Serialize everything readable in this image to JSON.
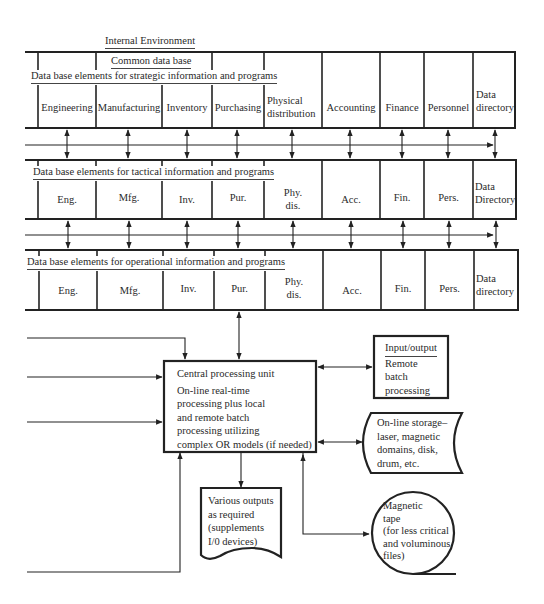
{
  "title": "Internal Environment",
  "common_db": "Common data base",
  "bands": {
    "strategic": {
      "label": "Data base elements for strategic information and programs",
      "cells": [
        "Engineering",
        "Manufacturing",
        "Inventory",
        "Purchasing",
        "Physical distribution",
        "Accounting",
        "Finance",
        "Personnel",
        "Data directory"
      ]
    },
    "tactical": {
      "label": "Data base elements for tactical information and programs",
      "cells": [
        "Eng.",
        "Mfg.",
        "Inv.",
        "Pur.",
        "Phy. dis.",
        "Acc.",
        "Fin.",
        "Pers.",
        "Data Directory"
      ]
    },
    "operational": {
      "label": "Data base elements for operational information and programs",
      "cells": [
        "Eng.",
        "Mfg.",
        "Inv.",
        "Pur.",
        "Phy. dis.",
        "Acc.",
        "Fin.",
        "Pers.",
        "Data directory"
      ]
    }
  },
  "cpu": {
    "title": "Central processing unit",
    "lines": [
      "On-line real-time",
      "processing plus local",
      "and remote batch",
      "processing utilizing",
      "complex OR models (if needed)"
    ]
  },
  "io": {
    "title": "Input/output",
    "lines": [
      "Remote",
      "batch",
      "processing"
    ]
  },
  "storage": {
    "lines": [
      "On-line storage–",
      "laser, magnetic",
      "domains, disk,",
      "drum, etc."
    ]
  },
  "outputs": {
    "lines": [
      "Various outputs",
      "as required",
      "(supplements",
      "I/0 devices)"
    ]
  },
  "tape": {
    "lines": [
      "Magnetic",
      "tape",
      "(for less critical",
      "and voluminous",
      "files)"
    ]
  },
  "colors": {
    "line": "#222222",
    "text": "#2a2a2a",
    "background": "#ffffff"
  }
}
